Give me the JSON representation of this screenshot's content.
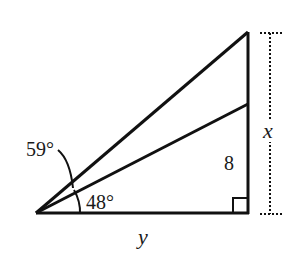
{
  "diagram": {
    "type": "geometry",
    "colors": {
      "stroke": "#111111",
      "background": "#ffffff"
    },
    "labels": {
      "angle_outer": "59°",
      "angle_inner": "48°",
      "side_vertical_segment": "8",
      "side_vertical_total": "x",
      "side_base": "y"
    },
    "markers": {
      "right_angle": "right-angle-marker"
    }
  }
}
